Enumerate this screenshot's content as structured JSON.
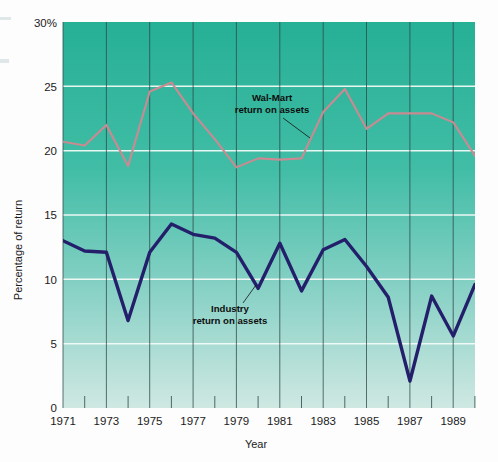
{
  "figure": {
    "background_color": "#fdfdfd",
    "plot_top_color": "#2bb39a",
    "plot_bottom_color": "#cfe8e2"
  },
  "axes": {
    "y_title": "Percentage of return",
    "x_title": "Year",
    "y_ticks": [
      "30%",
      "25",
      "20",
      "15",
      "10",
      "5",
      "0"
    ],
    "y_tick_values": [
      30,
      25,
      20,
      15,
      10,
      5,
      0
    ],
    "x_ticks": [
      "1971",
      "1973",
      "1975",
      "1977",
      "1979",
      "1981",
      "1983",
      "1985",
      "1987",
      "1989"
    ],
    "x_tick_values": [
      1971,
      1973,
      1975,
      1977,
      1979,
      1981,
      1983,
      1985,
      1987,
      1989
    ]
  },
  "annotations": [
    {
      "id": "walmart",
      "line1": "Wal-Mart",
      "line2": "return on assets"
    },
    {
      "id": "industry",
      "line1": "Industry",
      "line2": "return on assets"
    }
  ],
  "chart_data": {
    "type": "line",
    "title": "",
    "subtitle": "",
    "xlabel": "Year",
    "ylabel": "Percentage of return",
    "xlim": [
      1971,
      1990
    ],
    "ylim": [
      0,
      30
    ],
    "grid": "horizontal-white-and-vertical-dark",
    "legend": "inline-annotations",
    "x": [
      1971,
      1972,
      1973,
      1974,
      1975,
      1976,
      1977,
      1978,
      1979,
      1980,
      1981,
      1982,
      1983,
      1984,
      1985,
      1986,
      1987,
      1988,
      1989,
      1990
    ],
    "series": [
      {
        "name": "Wal-Mart return on assets",
        "color": "#c98a92",
        "values": [
          20.7,
          20.4,
          22.0,
          18.8,
          24.6,
          25.3,
          22.9,
          20.9,
          18.7,
          19.4,
          19.3,
          19.4,
          23.0,
          24.8,
          21.7,
          22.9,
          22.9,
          22.9,
          22.2,
          19.6
        ]
      },
      {
        "name": "Industry return on assets",
        "color": "#241f6b",
        "values": [
          13.0,
          12.2,
          12.1,
          6.8,
          12.1,
          14.3,
          13.5,
          13.2,
          12.1,
          9.3,
          12.8,
          9.1,
          12.3,
          13.1,
          11.0,
          8.6,
          2.1,
          8.7,
          5.6,
          9.6
        ]
      }
    ]
  }
}
